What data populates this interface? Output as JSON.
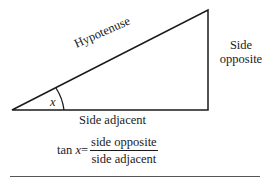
{
  "diagram": {
    "type": "right-triangle",
    "labels": {
      "hypotenuse": "Hypotenuse",
      "opposite_line1": "Side",
      "opposite_line2": "opposite",
      "adjacent": "Side adjacent",
      "angle": "x"
    },
    "formula": {
      "lhs_func": "tan",
      "lhs_var": "x",
      "equals": "=",
      "numerator": "side opposite",
      "denominator": "side adjacent"
    },
    "colors": {
      "stroke": "#1a1a1a",
      "background": "#ffffff"
    }
  }
}
